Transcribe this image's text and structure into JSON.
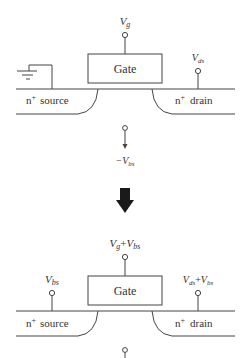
{
  "diagram": {
    "top": {
      "gate_label": "Gate",
      "source_region": {
        "sup": "+",
        "base": "n",
        "name": "source"
      },
      "drain_region": {
        "sup": "+",
        "base": "n",
        "name": "drain"
      },
      "gate_terminal": {
        "main": "V",
        "sub": "g"
      },
      "drain_terminal": {
        "main": "V",
        "sub": "ds"
      },
      "source_terminal": "ground-icon",
      "substrate_terminal": {
        "prefix": "−",
        "main": "V",
        "sub": "bs"
      }
    },
    "transition_arrow": "down-arrow",
    "bottom": {
      "gate_label": "Gate",
      "source_region": {
        "sup": "+",
        "base": "n",
        "name": "source"
      },
      "drain_region": {
        "sup": "+",
        "base": "n",
        "name": "drain"
      },
      "gate_terminal": {
        "main1": "V",
        "sub1": "g",
        "plus": "+",
        "main2": "V",
        "sub2": "bs"
      },
      "source_terminal": {
        "main": "V",
        "sub": "bs"
      },
      "drain_terminal": {
        "main1": "V",
        "sub1": "ds",
        "plus": "+",
        "main2": "V",
        "sub2": "bs"
      },
      "substrate_terminal": ""
    },
    "colors": {
      "line": "#444444",
      "text": "#333333",
      "arrow": "#1a1a1a",
      "background": "#ffffff"
    }
  }
}
